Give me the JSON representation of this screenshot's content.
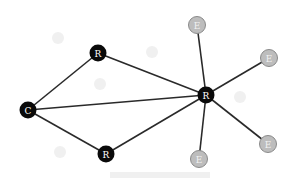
{
  "diagram": {
    "type": "network-graph",
    "colors": {
      "dark_fill": "#0a0a0a",
      "dark_text": "#ffffff",
      "light_fill": "#bdbdbd",
      "light_stroke": "#8a8a8a",
      "light_text": "#f2f2f2",
      "edge": "#2a2a2a",
      "background": "#ffffff"
    },
    "nodes": [
      {
        "id": "c1",
        "label": "C",
        "kind": "dark",
        "x": 28,
        "y": 110
      },
      {
        "id": "r_top",
        "label": "R",
        "kind": "dark",
        "x": 98,
        "y": 53
      },
      {
        "id": "r_bottom",
        "label": "R",
        "kind": "dark",
        "x": 106,
        "y": 154
      },
      {
        "id": "r_hub",
        "label": "R",
        "kind": "dark",
        "x": 206,
        "y": 95
      },
      {
        "id": "e_top",
        "label": "E",
        "kind": "light",
        "x": 197,
        "y": 25
      },
      {
        "id": "e_right",
        "label": "E",
        "kind": "light",
        "x": 269,
        "y": 58
      },
      {
        "id": "e_bottom",
        "label": "E",
        "kind": "light",
        "x": 199,
        "y": 159
      },
      {
        "id": "e_lower_right",
        "label": "E",
        "kind": "light",
        "x": 268,
        "y": 144
      }
    ],
    "edges": [
      {
        "from": "c1",
        "to": "r_top"
      },
      {
        "from": "c1",
        "to": "r_bottom"
      },
      {
        "from": "c1",
        "to": "r_hub"
      },
      {
        "from": "r_top",
        "to": "r_hub"
      },
      {
        "from": "r_bottom",
        "to": "r_hub"
      },
      {
        "from": "r_hub",
        "to": "e_top"
      },
      {
        "from": "r_hub",
        "to": "e_right"
      },
      {
        "from": "r_hub",
        "to": "e_bottom"
      },
      {
        "from": "r_hub",
        "to": "e_lower_right"
      }
    ]
  }
}
